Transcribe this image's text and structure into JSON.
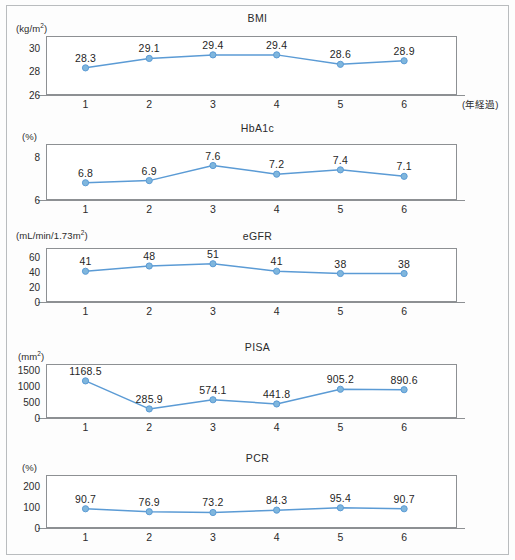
{
  "figure": {
    "x_axis_caption": "(年経過)",
    "categories": [
      "1",
      "2",
      "3",
      "4",
      "5",
      "6"
    ],
    "accent_color": "#5b9bd5",
    "marker_fill": "#7fb6dd",
    "frame_color": "#8d9093"
  },
  "chart_data": [
    {
      "type": "line",
      "title": "BMI",
      "ylabel": "(kg/m2)",
      "xlabel": "(年経過)",
      "categories": [
        "1",
        "2",
        "3",
        "4",
        "5",
        "6"
      ],
      "values": [
        28.3,
        29.1,
        29.4,
        29.4,
        28.6,
        28.9
      ],
      "point_labels": [
        "28.3",
        "29.1",
        "29.4",
        "29.4",
        "28.6",
        "28.9"
      ],
      "yticks": [
        "30",
        "28",
        "26"
      ],
      "ytick_values": [
        30,
        28,
        26
      ],
      "ylim": [
        26,
        31
      ],
      "grid": false,
      "legend": "none"
    },
    {
      "type": "line",
      "title": "HbA1c",
      "ylabel": "(%)",
      "xlabel": "",
      "categories": [
        "1",
        "2",
        "3",
        "4",
        "5",
        "6"
      ],
      "values": [
        6.8,
        6.9,
        7.6,
        7.2,
        7.4,
        7.1
      ],
      "point_labels": [
        "6.8",
        "6.9",
        "7.6",
        "7.2",
        "7.4",
        "7.1"
      ],
      "yticks": [
        "8",
        "6"
      ],
      "ytick_values": [
        8,
        6
      ],
      "ylim": [
        6,
        8.6
      ],
      "grid": false,
      "legend": "none"
    },
    {
      "type": "line",
      "title": "eGFR",
      "ylabel": "(mL/min/1.73m2)",
      "xlabel": "",
      "categories": [
        "1",
        "2",
        "3",
        "4",
        "5",
        "6"
      ],
      "values": [
        41,
        48,
        51,
        41,
        38,
        38
      ],
      "point_labels": [
        "41",
        "48",
        "51",
        "41",
        "38",
        "38"
      ],
      "yticks": [
        "60",
        "40",
        "20",
        "0"
      ],
      "ytick_values": [
        60,
        40,
        20,
        0
      ],
      "ylim": [
        0,
        72
      ],
      "grid": false,
      "legend": "none"
    },
    {
      "type": "line",
      "title": "PISA",
      "ylabel": "(mm2)",
      "xlabel": "",
      "categories": [
        "1",
        "2",
        "3",
        "4",
        "5",
        "6"
      ],
      "values": [
        1168.5,
        285.9,
        574.1,
        441.8,
        905.2,
        890.6
      ],
      "point_labels": [
        "1168.5",
        "285.9",
        "574.1",
        "441.8",
        "905.2",
        "890.6"
      ],
      "yticks": [
        "1500",
        "1000",
        "500",
        "0"
      ],
      "ytick_values": [
        1500,
        1000,
        500,
        0
      ],
      "ylim": [
        0,
        1700
      ],
      "grid": false,
      "legend": "none"
    },
    {
      "type": "line",
      "title": "PCR",
      "ylabel": "(%)",
      "xlabel": "",
      "categories": [
        "1",
        "2",
        "3",
        "4",
        "5",
        "6"
      ],
      "values": [
        90.7,
        76.9,
        73.2,
        84.3,
        95.4,
        90.7
      ],
      "point_labels": [
        "90.7",
        "76.9",
        "73.2",
        "84.3",
        "95.4",
        "90.7"
      ],
      "yticks": [
        "200",
        "100",
        "0"
      ],
      "ytick_values": [
        200,
        100,
        0
      ],
      "ylim": [
        0,
        250
      ],
      "grid": false,
      "legend": "none"
    }
  ]
}
